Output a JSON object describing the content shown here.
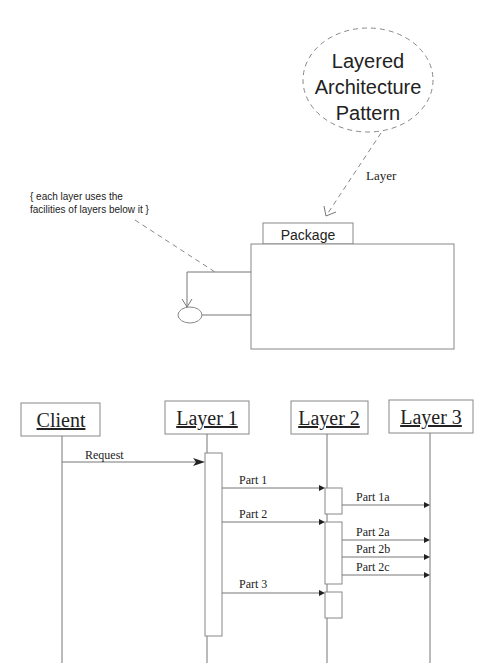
{
  "pattern_bubble": {
    "line1": "Layered",
    "line2": "Architecture",
    "line3": "Pattern"
  },
  "stereotype_label": "Layer",
  "note": {
    "line1": "{ each layer uses the",
    "line2": "facilities of layers below it }"
  },
  "package": {
    "tab_label": "Package"
  },
  "sequence": {
    "lifelines": [
      {
        "label": "Client"
      },
      {
        "label": "Layer 1"
      },
      {
        "label": "Layer 2"
      },
      {
        "label": "Layer 3"
      }
    ],
    "messages": [
      {
        "label": "Request",
        "from": "Client",
        "to": "Layer 1"
      },
      {
        "label": "Part 1",
        "from": "Layer 1",
        "to": "Layer 2"
      },
      {
        "label": "Part 1a",
        "from": "Layer 2",
        "to": "Layer 3"
      },
      {
        "label": "Part 2",
        "from": "Layer 1",
        "to": "Layer 2"
      },
      {
        "label": "Part 2a",
        "from": "Layer 2",
        "to": "Layer 3"
      },
      {
        "label": "Part 2b",
        "from": "Layer 2",
        "to": "Layer 3"
      },
      {
        "label": "Part 2c",
        "from": "Layer 2",
        "to": "Layer 3"
      },
      {
        "label": "Part 3",
        "from": "Layer 1",
        "to": "Layer 2"
      }
    ]
  }
}
